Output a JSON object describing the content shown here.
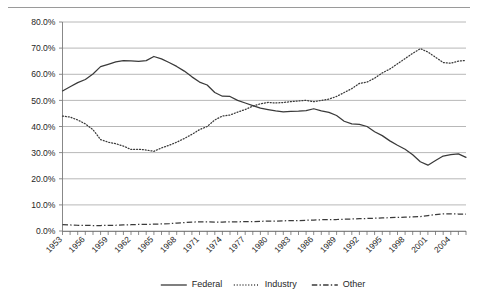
{
  "chart_data": {
    "type": "line",
    "title": "",
    "subtitle": "",
    "xlabel": "",
    "ylabel": "",
    "ylim": [
      0,
      80
    ],
    "ytick_labels": [
      "0.0%",
      "10.0%",
      "20.0%",
      "30.0%",
      "40.0%",
      "50.0%",
      "60.0%",
      "70.0%",
      "80.0%"
    ],
    "ytick_values": [
      0,
      10,
      20,
      30,
      40,
      50,
      60,
      70,
      80
    ],
    "grid": "horizontal",
    "legend_position": "bottom",
    "xlim": [
      1953,
      2006
    ],
    "xtick_labels": [
      "1953",
      "1956",
      "1959",
      "1962",
      "1965",
      "1968",
      "1971",
      "1974",
      "1977",
      "1980",
      "1983",
      "1986",
      "1989",
      "1992",
      "1995",
      "1998",
      "2001",
      "2004"
    ],
    "x": [
      1953,
      1954,
      1955,
      1956,
      1957,
      1958,
      1959,
      1960,
      1961,
      1962,
      1963,
      1964,
      1965,
      1966,
      1967,
      1968,
      1969,
      1970,
      1971,
      1972,
      1973,
      1974,
      1975,
      1976,
      1977,
      1978,
      1979,
      1980,
      1981,
      1982,
      1983,
      1984,
      1985,
      1986,
      1987,
      1988,
      1989,
      1990,
      1991,
      1992,
      1993,
      1994,
      1995,
      1996,
      1997,
      1998,
      1999,
      2000,
      2001,
      2002,
      2003,
      2004,
      2005,
      2006
    ],
    "series": [
      {
        "name": "Federal",
        "style": "solid",
        "values": [
          53.6,
          55.2,
          56.8,
          58.0,
          60.1,
          62.9,
          63.8,
          64.7,
          65.2,
          65.1,
          64.9,
          65.2,
          66.8,
          65.9,
          64.5,
          63.0,
          61.2,
          59.0,
          57.0,
          55.9,
          53.0,
          51.6,
          51.5,
          50.0,
          49.0,
          48.0,
          47.0,
          46.5,
          46.0,
          45.6,
          45.8,
          45.9,
          46.1,
          46.8,
          46.0,
          45.4,
          44.2,
          42.0,
          41.0,
          40.8,
          40.0,
          38.0,
          36.5,
          34.5,
          32.8,
          31.3,
          29.2,
          26.5,
          25.2,
          27.0,
          28.7,
          29.2,
          29.5,
          28.2
        ]
      },
      {
        "name": "Industry",
        "style": "dotted",
        "values": [
          44.0,
          43.6,
          42.5,
          41.0,
          38.8,
          35.0,
          34.0,
          33.4,
          32.5,
          31.2,
          31.3,
          31.0,
          30.5,
          31.8,
          32.8,
          34.0,
          35.4,
          37.0,
          38.8,
          40.0,
          42.5,
          44.0,
          44.4,
          45.5,
          46.5,
          47.8,
          48.7,
          49.2,
          49.0,
          49.2,
          49.5,
          49.8,
          50.0,
          49.5,
          50.0,
          50.5,
          51.5,
          53.0,
          54.5,
          56.5,
          57.0,
          58.5,
          60.5,
          62.0,
          64.0,
          66.0,
          68.0,
          69.8,
          68.5,
          66.5,
          64.5,
          64.2,
          65.0,
          65.3
        ]
      },
      {
        "name": "Other",
        "style": "dash-dot",
        "values": [
          2.4,
          2.3,
          2.2,
          2.2,
          2.1,
          2.1,
          2.2,
          2.2,
          2.3,
          2.4,
          2.5,
          2.5,
          2.6,
          2.7,
          2.8,
          3.0,
          3.2,
          3.4,
          3.5,
          3.5,
          3.4,
          3.4,
          3.5,
          3.5,
          3.6,
          3.6,
          3.7,
          3.8,
          3.8,
          3.9,
          4.0,
          4.0,
          4.1,
          4.2,
          4.3,
          4.4,
          4.4,
          4.5,
          4.6,
          4.7,
          4.8,
          4.9,
          5.0,
          5.1,
          5.2,
          5.3,
          5.4,
          5.5,
          5.9,
          6.3,
          6.6,
          6.6,
          6.5,
          6.5
        ]
      }
    ]
  },
  "legend": {
    "items": [
      {
        "label": "Federal",
        "style": "solid"
      },
      {
        "label": "Industry",
        "style": "dotted"
      },
      {
        "label": "Other",
        "style": "dash-dot"
      }
    ]
  },
  "colors": {
    "line": "#3a3a3a",
    "grid": "#a6a6a6",
    "axis": "#7a7a7a",
    "text": "#262626",
    "background": "#ffffff"
  }
}
